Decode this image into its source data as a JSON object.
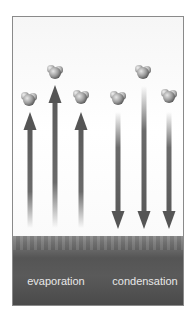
{
  "diagram": {
    "title": "",
    "labels": {
      "evaporation": "evaporation",
      "condensation": "condensation"
    },
    "colors": {
      "arrow": "#5a5a5a",
      "water": "#555555",
      "frame": "#8a8a8a",
      "label": "#e8e8e8"
    },
    "arrows": [
      {
        "direction": "up",
        "group": "evaporation"
      },
      {
        "direction": "up",
        "group": "evaporation"
      },
      {
        "direction": "up",
        "group": "evaporation"
      },
      {
        "direction": "down",
        "group": "condensation"
      },
      {
        "direction": "down",
        "group": "condensation"
      },
      {
        "direction": "down",
        "group": "condensation"
      }
    ],
    "molecules_count": 6,
    "molecule_icon": "water-molecule-icon"
  }
}
